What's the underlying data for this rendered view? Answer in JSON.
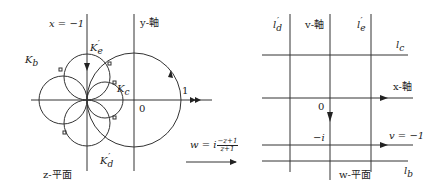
{
  "diagram": {
    "type": "conformal-mapping",
    "transform_label": {
      "prefix": "w = i",
      "numerator": "−z+1",
      "denominator": "z+1"
    },
    "z_plane": {
      "name": "z-平面",
      "labels": {
        "line_x_minus_1": "x = −1",
        "y_axis": "y-軸",
        "K_b": "K",
        "K_b_sub": "b",
        "K_e": "K",
        "K_e_sub": "e",
        "K_e_prime": "′",
        "K_c": "K",
        "K_c_sub": "c",
        "K_d": "K",
        "K_d_sub": "d",
        "K_d_prime": "′",
        "origin": "0",
        "one": "1"
      }
    },
    "w_plane": {
      "name": "w-平面",
      "labels": {
        "l_d": "l",
        "l_d_sub": "d",
        "l_d_prime": "′",
        "v_axis": "v-軸",
        "l_e": "l",
        "l_e_sub": "e",
        "l_e_prime": "′",
        "l_c": "l",
        "l_c_sub": "c",
        "x_axis": "x-軸",
        "origin": "0",
        "minus_i": "−i",
        "v_eq": "v = −1",
        "l_b": "l",
        "l_b_sub": "b"
      }
    },
    "colors": {
      "line": "#333333",
      "text": "#222222",
      "background": "#ffffff"
    }
  }
}
